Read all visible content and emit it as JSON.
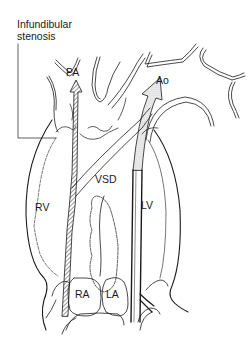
{
  "diagram": {
    "callout": {
      "line1": "Infundibular",
      "line2": "stenosis"
    },
    "labels": {
      "pa": "PA",
      "ao": "Ao",
      "rv": "RV",
      "vsd": "VSD",
      "lv": "LV",
      "ra": "RA",
      "la": "LA"
    },
    "arrows": [
      {
        "name": "pa-flow-arrow",
        "fill": "hatched",
        "direction": "up",
        "target": "PA"
      },
      {
        "name": "ao-flow-arrow",
        "fill": "stippled",
        "direction": "up-right",
        "target": "Ao"
      }
    ],
    "colors": {
      "line": "#1a1a1a",
      "background": "#ffffff"
    }
  }
}
